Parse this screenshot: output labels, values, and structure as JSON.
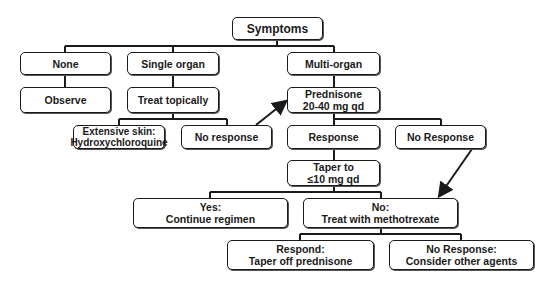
{
  "diagram": {
    "type": "flowchart",
    "nodes": {
      "symptoms": {
        "lines": [
          "Symptoms"
        ]
      },
      "none": {
        "lines": [
          "None"
        ]
      },
      "single_organ": {
        "lines": [
          "Single organ"
        ]
      },
      "multi_organ": {
        "lines": [
          "Multi-organ"
        ]
      },
      "observe": {
        "lines": [
          "Observe"
        ]
      },
      "treat_topically": {
        "lines": [
          "Treat topically"
        ]
      },
      "extensive_skin": {
        "lines": [
          "Extensive skin:",
          "Hydroxychloroquine"
        ]
      },
      "no_response_topical": {
        "lines": [
          "No response"
        ]
      },
      "prednisone": {
        "lines": [
          "Prednisone",
          "20-40 mg qd"
        ]
      },
      "response": {
        "lines": [
          "Response"
        ]
      },
      "no_response_prednisone": {
        "lines": [
          "No Response"
        ]
      },
      "taper": {
        "lines": [
          "Taper to",
          "≤10 mg qd"
        ]
      },
      "yes_continue": {
        "lines": [
          "Yes:",
          "Continue regimen"
        ]
      },
      "no_methotrexate": {
        "lines": [
          "No:",
          "Treat with methotrexate"
        ]
      },
      "respond_taper_off": {
        "lines": [
          "Respond:",
          "Taper off prednisone"
        ]
      },
      "no_response_other": {
        "lines": [
          "No Response:",
          "Consider other agents"
        ]
      }
    },
    "edges": [
      {
        "from": "symptoms",
        "to": "none"
      },
      {
        "from": "symptoms",
        "to": "single_organ"
      },
      {
        "from": "symptoms",
        "to": "multi_organ"
      },
      {
        "from": "none",
        "to": "observe"
      },
      {
        "from": "single_organ",
        "to": "treat_topically"
      },
      {
        "from": "multi_organ",
        "to": "prednisone"
      },
      {
        "from": "treat_topically",
        "to": "extensive_skin"
      },
      {
        "from": "treat_topically",
        "to": "no_response_topical"
      },
      {
        "from": "no_response_topical",
        "to": "prednisone",
        "arrow": true
      },
      {
        "from": "prednisone",
        "to": "response"
      },
      {
        "from": "prednisone",
        "to": "no_response_prednisone"
      },
      {
        "from": "response",
        "to": "taper"
      },
      {
        "from": "taper",
        "to": "yes_continue"
      },
      {
        "from": "taper",
        "to": "no_methotrexate"
      },
      {
        "from": "no_response_prednisone",
        "to": "no_methotrexate",
        "arrow": true
      },
      {
        "from": "no_methotrexate",
        "to": "respond_taper_off"
      },
      {
        "from": "no_methotrexate",
        "to": "no_response_other"
      }
    ]
  }
}
